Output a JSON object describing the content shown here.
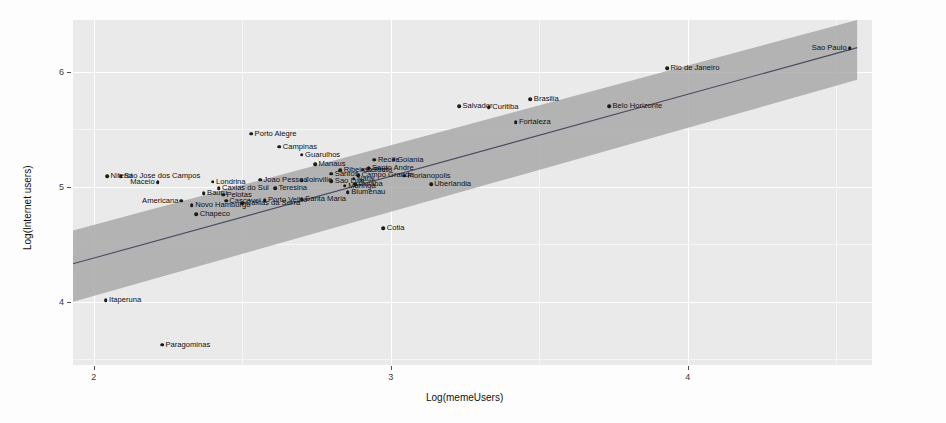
{
  "chart_data": {
    "type": "scatter",
    "title": "",
    "xlabel": "Log(memeUsers)",
    "ylabel": "Log(Internet users)",
    "xlim": [
      1.93,
      4.62
    ],
    "ylim": [
      3.45,
      6.45
    ],
    "xticks": [
      2,
      3,
      4
    ],
    "yticks": [
      4,
      5,
      6
    ],
    "grid": true,
    "legend": "none",
    "panel_bg": "#eaeaea",
    "point_color": "#1b1b1b",
    "line_color": "#4a4a62",
    "ribbon_color": "#a3a3a3",
    "fit": {
      "type": "linear",
      "x_start": 1.93,
      "x_end": 4.57,
      "y_start": 4.33,
      "y_end": 6.21
    },
    "ribbon": {
      "x_start": 1.93,
      "x_end": 4.57,
      "upper_start": 4.62,
      "upper_end": 6.45,
      "lower_start": 4.0,
      "lower_end": 5.93
    },
    "points": [
      {
        "label": "Sao Paulo",
        "x": 4.545,
        "y": 6.205,
        "lab_side": "left"
      },
      {
        "label": "Rio de Janeiro",
        "x": 3.93,
        "y": 6.03,
        "lab_side": "right"
      },
      {
        "label": "Belo Horizonte",
        "x": 3.735,
        "y": 5.7,
        "lab_side": "right"
      },
      {
        "label": "Brasilia",
        "x": 3.47,
        "y": 5.76,
        "lab_side": "right"
      },
      {
        "label": "Curitiba",
        "x": 3.33,
        "y": 5.69,
        "lab_side": "right"
      },
      {
        "label": "Salvador",
        "x": 3.23,
        "y": 5.7,
        "lab_side": "right"
      },
      {
        "label": "Fortaleza",
        "x": 3.42,
        "y": 5.56,
        "lab_side": "right"
      },
      {
        "label": "Porto Alegre",
        "x": 2.53,
        "y": 5.46,
        "lab_side": "right"
      },
      {
        "label": "Campinas",
        "x": 2.625,
        "y": 5.35,
        "lab_side": "right"
      },
      {
        "label": "Guarulhos",
        "x": 2.7,
        "y": 5.28,
        "lab_side": "right"
      },
      {
        "label": "Recife",
        "x": 2.945,
        "y": 5.235,
        "lab_side": "right"
      },
      {
        "label": "Goiania",
        "x": 3.01,
        "y": 5.235,
        "lab_side": "right"
      },
      {
        "label": "Santo Andre",
        "x": 2.925,
        "y": 5.16,
        "lab_side": "right"
      },
      {
        "label": "Manaus",
        "x": 2.745,
        "y": 5.195,
        "lab_side": "right"
      },
      {
        "label": "Ribeirao Preto",
        "x": 2.83,
        "y": 5.145,
        "lab_side": "right"
      },
      {
        "label": "Santos",
        "x": 2.8,
        "y": 5.115,
        "lab_side": "right"
      },
      {
        "label": "Niteroi",
        "x": 2.045,
        "y": 5.09,
        "lab_side": "right"
      },
      {
        "label": "Sao Jose dos Campos",
        "x": 2.09,
        "y": 5.09,
        "lab_side": "right"
      },
      {
        "label": "Joao Pessoa",
        "x": 2.56,
        "y": 5.06,
        "lab_side": "right"
      },
      {
        "label": "Joinville",
        "x": 2.7,
        "y": 5.055,
        "lab_side": "right"
      },
      {
        "label": "Sao Luis",
        "x": 2.8,
        "y": 5.05,
        "lab_side": "right"
      },
      {
        "label": "Campo Grande",
        "x": 2.89,
        "y": 5.1,
        "lab_side": "right"
      },
      {
        "label": "Belem",
        "x": 2.905,
        "y": 5.15,
        "lab_side": "right"
      },
      {
        "label": "Florianopolis",
        "x": 3.045,
        "y": 5.095,
        "lab_side": "right"
      },
      {
        "label": "Natal",
        "x": 2.875,
        "y": 5.07,
        "lab_side": "right"
      },
      {
        "label": "Londrina",
        "x": 2.4,
        "y": 5.045,
        "lab_side": "right"
      },
      {
        "label": "Maceio",
        "x": 2.215,
        "y": 5.04,
        "lab_side": "left"
      },
      {
        "label": "Maringa",
        "x": 2.845,
        "y": 5.01,
        "lab_side": "right"
      },
      {
        "label": "Cuiaba",
        "x": 2.88,
        "y": 5.02,
        "lab_side": "right"
      },
      {
        "label": "Caxias do Sul",
        "x": 2.42,
        "y": 4.985,
        "lab_side": "right"
      },
      {
        "label": "Teresina",
        "x": 2.61,
        "y": 4.985,
        "lab_side": "right"
      },
      {
        "label": "Blumenau",
        "x": 2.855,
        "y": 4.955,
        "lab_side": "right"
      },
      {
        "label": "Uberlandia",
        "x": 3.135,
        "y": 5.02,
        "lab_side": "right"
      },
      {
        "label": "Bauru",
        "x": 2.37,
        "y": 4.945,
        "lab_side": "right"
      },
      {
        "label": "Pelotas",
        "x": 2.435,
        "y": 4.93,
        "lab_side": "right"
      },
      {
        "label": "Americana",
        "x": 2.295,
        "y": 4.88,
        "lab_side": "left"
      },
      {
        "label": "Cascavel",
        "x": 2.445,
        "y": 4.88,
        "lab_side": "right"
      },
      {
        "label": "Porto Velho",
        "x": 2.575,
        "y": 4.885,
        "lab_side": "right"
      },
      {
        "label": "Santa Maria",
        "x": 2.7,
        "y": 4.89,
        "lab_side": "right"
      },
      {
        "label": "Caxias da Serra",
        "x": 2.5,
        "y": 4.855,
        "lab_side": "right"
      },
      {
        "label": "Novo Hamburgo",
        "x": 2.33,
        "y": 4.84,
        "lab_side": "right"
      },
      {
        "label": "Chapeco",
        "x": 2.345,
        "y": 4.76,
        "lab_side": "right"
      },
      {
        "label": "Cotia",
        "x": 2.975,
        "y": 4.64,
        "lab_side": "right"
      },
      {
        "label": "Itaperuna",
        "x": 2.04,
        "y": 4.015,
        "lab_side": "right"
      },
      {
        "label": "Paragominas",
        "x": 2.23,
        "y": 3.625,
        "lab_side": "right"
      }
    ]
  }
}
